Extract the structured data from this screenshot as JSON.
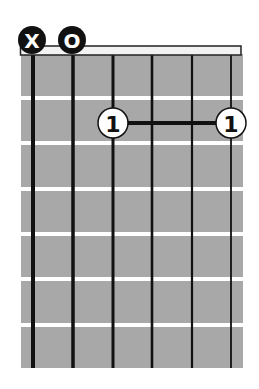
{
  "chord_diagram": {
    "type": "guitar-chord",
    "num_strings": 6,
    "num_frets": 7,
    "colors": {
      "fretboard": "#a8a8a8",
      "fret_line": "#ffffff",
      "string": "#111111",
      "nut_fill": "#f2f2f2",
      "nut_border": "#222222",
      "open_muted_marker": "#111111",
      "finger_fill": "#ffffff",
      "finger_border": "#111111",
      "barre": "#111111"
    },
    "string_markers": [
      {
        "string": 1,
        "symbol": "X",
        "meaning": "muted"
      },
      {
        "string": 2,
        "symbol": "O",
        "meaning": "open"
      }
    ],
    "fingers": [
      {
        "string": 3,
        "fret": 2,
        "label": "1"
      },
      {
        "string": 6,
        "fret": 2,
        "label": "1"
      }
    ],
    "barre": {
      "fret": 2,
      "from_string": 3,
      "to_string": 6,
      "finger": "1"
    }
  }
}
